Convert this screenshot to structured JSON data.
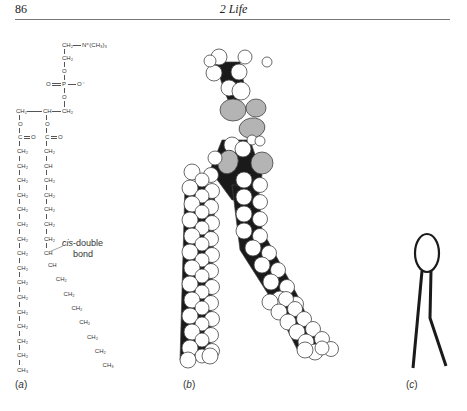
{
  "header": {
    "page_number": "86",
    "running_head": "2 Life"
  },
  "figure": {
    "panels": [
      {
        "id": "a",
        "label_open": "(",
        "label_letter": "a",
        "label_close": ")",
        "description": "structural formula"
      },
      {
        "id": "b",
        "label_open": "(",
        "label_letter": "b",
        "label_close": ")",
        "description": "space-filling model"
      },
      {
        "id": "c",
        "label_open": "(",
        "label_letter": "c",
        "label_close": ")",
        "description": "schematic symbol"
      }
    ],
    "formula": {
      "head_group": {
        "top_ch2": "CH₂",
        "n_group": "N⁺(CH₃)₃",
        "ch2_2": "CH₂",
        "o1": "O",
        "p_left_o": "O",
        "p": "P",
        "p_right_o": "O⁻",
        "o2": "O"
      },
      "glycerol": {
        "left": "CH₂",
        "middle": "CH",
        "right": "CH₂"
      },
      "ester_o": "O",
      "carbonyl_c": "C",
      "carbonyl_o": "O",
      "left_chain": [
        "CH₂",
        "CH₂",
        "CH₂",
        "CH₂",
        "CH₂",
        "CH₂",
        "CH₂",
        "CH₂",
        "CH₂",
        "CH₂",
        "CH₂",
        "CH₂",
        "CH₂",
        "CH₂",
        "CH₂",
        "CH₃"
      ],
      "right_chain_straight": [
        "CH₂",
        "CH",
        "CH₂",
        "CH₂",
        "CH₂",
        "CH₂",
        "CH₂",
        "CH"
      ],
      "right_chain_bent": [
        "CH",
        "CH₂",
        "CH₂",
        "CH₂",
        "CH₂",
        "CH₂",
        "CH₂",
        "CH₃"
      ],
      "callout": {
        "italic": "cis",
        "rest": "-double",
        "line2": "bond"
      }
    }
  }
}
